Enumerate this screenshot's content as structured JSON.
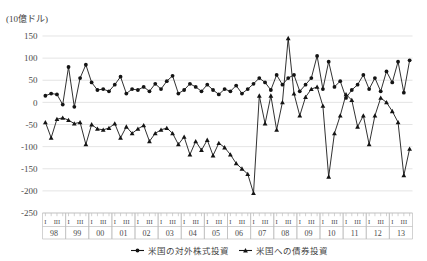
{
  "chart_data": {
    "type": "line",
    "title": "",
    "unit_label": "(10億ドル)",
    "xlabel": "",
    "ylabel": "",
    "ylim": [
      -250,
      150
    ],
    "ytick_values": [
      150,
      100,
      50,
      0,
      -50,
      -100,
      -150,
      -200,
      -250
    ],
    "ytick_labels": [
      "150",
      "100",
      "50",
      "0",
      "-50",
      "-100",
      "-150",
      "-200",
      "-250"
    ],
    "grid": true,
    "legend_position": "bottom",
    "quarter_tick_labels": [
      "I",
      "III"
    ],
    "year_labels": [
      "98",
      "99",
      "00",
      "01",
      "02",
      "03",
      "04",
      "05",
      "06",
      "07",
      "08",
      "09",
      "10",
      "11",
      "12",
      "13"
    ],
    "x": [
      "98 I",
      "98 II",
      "98 III",
      "98 IV",
      "99 I",
      "99 II",
      "99 III",
      "99 IV",
      "00 I",
      "00 II",
      "00 III",
      "00 IV",
      "01 I",
      "01 II",
      "01 III",
      "01 IV",
      "02 I",
      "02 II",
      "02 III",
      "02 IV",
      "03 I",
      "03 II",
      "03 III",
      "03 IV",
      "04 I",
      "04 II",
      "04 III",
      "04 IV",
      "05 I",
      "05 II",
      "05 III",
      "05 IV",
      "06 I",
      "06 II",
      "06 III",
      "06 IV",
      "07 I",
      "07 II",
      "07 III",
      "07 IV",
      "08 I",
      "08 II",
      "08 III",
      "08 IV",
      "09 I",
      "09 II",
      "09 III",
      "09 IV",
      "10 I",
      "10 II",
      "10 III",
      "10 IV",
      "11 I",
      "11 II",
      "11 III",
      "11 IV",
      "12 I",
      "12 II",
      "12 III",
      "12 IV",
      "13 I",
      "13 II",
      "13 III",
      "13 IV"
    ],
    "series": [
      {
        "name": "米国の対外株式投資",
        "marker": "circle",
        "color": "#141414",
        "values": [
          15,
          20,
          18,
          -5,
          80,
          -10,
          55,
          85,
          45,
          28,
          30,
          25,
          40,
          58,
          20,
          30,
          28,
          35,
          25,
          42,
          30,
          48,
          60,
          20,
          28,
          42,
          35,
          25,
          40,
          28,
          18,
          30,
          25,
          38,
          20,
          30,
          42,
          55,
          45,
          28,
          62,
          40,
          55,
          62,
          25,
          40,
          55,
          105,
          30,
          92,
          35,
          48,
          10,
          28,
          40,
          62,
          30,
          55,
          25,
          70,
          45,
          92,
          22,
          95
        ]
      },
      {
        "name": "米国への債券投資",
        "marker": "triangle",
        "color": "#141414",
        "values": [
          -45,
          -80,
          -38,
          -35,
          -40,
          -48,
          -45,
          -95,
          -50,
          -60,
          -62,
          -58,
          -48,
          -80,
          -55,
          -70,
          -60,
          -52,
          -88,
          -70,
          -62,
          -58,
          -70,
          -95,
          -78,
          -118,
          -88,
          -108,
          -85,
          -120,
          -92,
          -102,
          -118,
          -138,
          -150,
          -162,
          -205,
          15,
          -48,
          15,
          -62,
          0,
          145,
          20,
          -30,
          12,
          30,
          35,
          -8,
          -168,
          -70,
          -30,
          18,
          5,
          -55,
          -30,
          -95,
          -30,
          10,
          0,
          -20,
          -45,
          -165,
          -105
        ]
      }
    ]
  },
  "legend": {
    "items": [
      {
        "label": "米国の対外株式投資",
        "marker": "circle"
      },
      {
        "label": "米国への債券投資",
        "marker": "triangle"
      }
    ]
  }
}
